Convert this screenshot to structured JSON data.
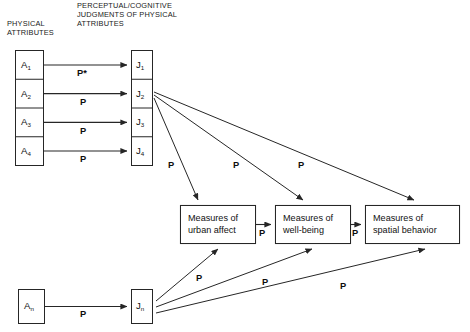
{
  "diagram": {
    "background_color": "#ffffff",
    "line_color": "#262626",
    "text_color": "#111111"
  },
  "headers": {
    "physical": "PHYSICAL\nATTRIBUTES",
    "judgments": "PERCEPTUAL/COGNITIVE\nJUDGMENTS OF PHYSICAL\nATTRIBUTES"
  },
  "attribute_nodes": [
    {
      "letter": "A",
      "subscript": "1"
    },
    {
      "letter": "A",
      "subscript": "2"
    },
    {
      "letter": "A",
      "subscript": "3"
    },
    {
      "letter": "A",
      "subscript": "4"
    }
  ],
  "judgment_nodes": [
    {
      "letter": "J",
      "subscript": "1"
    },
    {
      "letter": "J",
      "subscript": "2"
    },
    {
      "letter": "J",
      "subscript": "3"
    },
    {
      "letter": "J",
      "subscript": "4"
    }
  ],
  "bottom_nodes": {
    "attribute": {
      "letter": "A",
      "subscript": "n"
    },
    "judgment": {
      "letter": "J",
      "subscript": "n"
    }
  },
  "measure_boxes": [
    {
      "text": "Measures of\nurban affect"
    },
    {
      "text": "Measures of\nwell-being"
    },
    {
      "text": "Measures of\nspatial behavior"
    }
  ],
  "path_labels": {
    "a1_to_j1": "P*",
    "a2_to_j2": "P",
    "a3_to_j3": "P",
    "a4_to_j4": "P",
    "an_to_jn": "P",
    "j_to_urban_affect": "P",
    "j_to_well_being": "P",
    "j_to_spatial_behavior": "P",
    "urban_affect_to_well_being": "P",
    "well_being_to_spatial_behavior": "P",
    "jn_to_urban_affect": "P",
    "jn_to_well_being": "P",
    "jn_to_spatial_behavior": "P"
  }
}
